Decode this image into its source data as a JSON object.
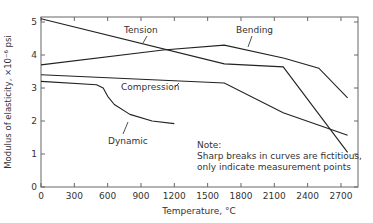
{
  "chart_data": {
    "type": "line",
    "title": "",
    "xlabel": "Temperature, °C",
    "ylabel": "Modulus of elasticity, ×10⁻⁶ psi",
    "xlim": [
      0,
      2860
    ],
    "ylim": [
      0,
      5.15
    ],
    "xticks": [
      0,
      300,
      600,
      900,
      1200,
      1500,
      1800,
      2100,
      2400,
      2700
    ],
    "yticks": [
      0,
      1,
      2,
      3,
      4,
      5
    ],
    "grid": false,
    "legend": "inline labels",
    "series": [
      {
        "name": "Tension",
        "x": [
          0,
          1650,
          2180,
          2760
        ],
        "y": [
          5.1,
          3.73,
          3.64,
          1.05
        ]
      },
      {
        "name": "Bending",
        "x": [
          0,
          1100,
          1650,
          2190,
          2500,
          2760
        ],
        "y": [
          3.7,
          4.15,
          4.3,
          3.9,
          3.6,
          2.7
        ]
      },
      {
        "name": "Compression",
        "x": [
          0,
          1650,
          2180,
          2760
        ],
        "y": [
          3.4,
          3.15,
          2.25,
          1.57
        ]
      },
      {
        "name": "Dynamic",
        "x": [
          0,
          500,
          560,
          600,
          660,
          800,
          1000,
          1200
        ],
        "y": [
          3.2,
          3.1,
          3.0,
          2.75,
          2.5,
          2.2,
          2.0,
          1.92
        ]
      }
    ],
    "annotations": [
      "Tension",
      "Bending",
      "Compression",
      "Dynamic",
      "Note:",
      "Sharp breaks in curves are fictitious,",
      "only indicate measurement points"
    ]
  },
  "labels": {
    "tension": "Tension",
    "bending": "Bending",
    "compression": "Compression",
    "dynamic": "Dynamic",
    "xlabel": "Temperature, °C",
    "ylabel": "Modulus of elasticity, ×10⁻⁶ psi"
  },
  "note": {
    "title": "Note:",
    "line1": "Sharp breaks in curves are fictitious,",
    "line2": "only indicate measurement points"
  },
  "colors": {
    "line": "#222222",
    "axis": "#555555",
    "text": "#333333"
  }
}
